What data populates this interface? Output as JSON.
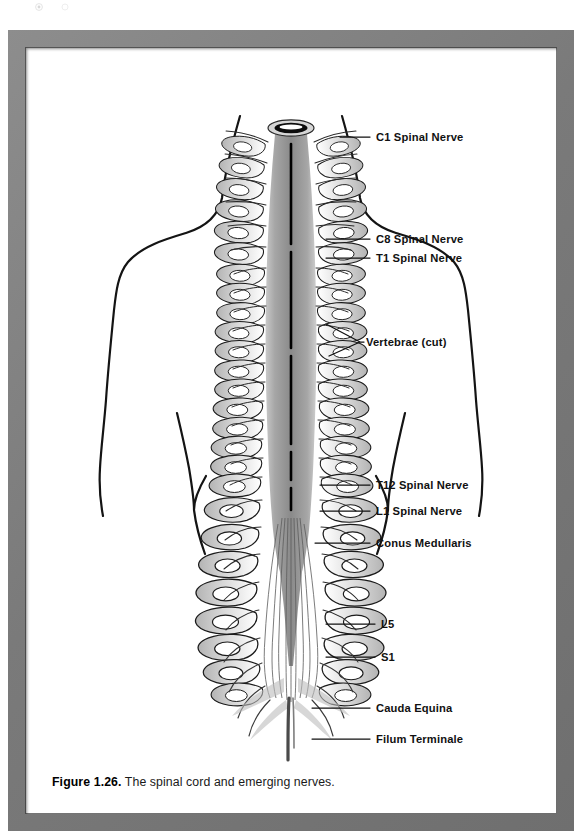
{
  "figure": {
    "caption_label": "Figure 1.26.",
    "caption_text": " The spinal cord and emerging nerves.",
    "frame_color": "#7e7e7e",
    "canvas_color": "#ffffff",
    "ink_color": "#111111"
  },
  "illustration": {
    "title": "The spinal cord and emerging nerves",
    "subject": "posterior view of human torso with vertebral column cut open exposing spinal cord",
    "cord_color": "#9a9a9a",
    "cord_center_line_color": "#000000",
    "outline_color": "#141414"
  },
  "labels": [
    {
      "id": "c1",
      "text": "C1 Spinal Nerve",
      "x": 350,
      "y": 93,
      "leader_x1": 314,
      "leader_y1": 89,
      "leader_x2": 344,
      "leader_y2": 89
    },
    {
      "id": "c8",
      "text": "C8 Spinal Nerve",
      "x": 350,
      "y": 195,
      "leader_x1": 300,
      "leader_y1": 191,
      "leader_x2": 344,
      "leader_y2": 191
    },
    {
      "id": "t1",
      "text": "T1 Spinal Nerve",
      "x": 350,
      "y": 214,
      "leader_x1": 300,
      "leader_y1": 210,
      "leader_x2": 344,
      "leader_y2": 210
    },
    {
      "id": "vert",
      "text": "Vertebrae (cut)",
      "x": 340,
      "y": 298,
      "leader_x1": 306,
      "leader_y1": 294,
      "leader_x2": 334,
      "leader_y2": 294
    },
    {
      "id": "t12",
      "text": "T12 Spinal Nerve",
      "x": 350,
      "y": 441,
      "leader_x1": 294,
      "leader_y1": 437,
      "leader_x2": 344,
      "leader_y2": 437
    },
    {
      "id": "l1",
      "text": "L1 Spinal Nerve",
      "x": 350,
      "y": 467,
      "leader_x1": 294,
      "leader_y1": 463,
      "leader_x2": 344,
      "leader_y2": 463
    },
    {
      "id": "conus",
      "text": "Conus Medullaris",
      "x": 350,
      "y": 499,
      "leader_x1": 289,
      "leader_y1": 495,
      "leader_x2": 344,
      "leader_y2": 495
    },
    {
      "id": "l5",
      "text": "L5",
      "x": 355,
      "y": 580,
      "leader_x1": 300,
      "leader_y1": 576,
      "leader_x2": 349,
      "leader_y2": 576
    },
    {
      "id": "s1",
      "text": "S1",
      "x": 355,
      "y": 613,
      "leader_x1": 300,
      "leader_y1": 609,
      "leader_x2": 349,
      "leader_y2": 609
    },
    {
      "id": "cauda",
      "text": "Cauda Equina",
      "x": 350,
      "y": 664,
      "leader_x1": 286,
      "leader_y1": 660,
      "leader_x2": 344,
      "leader_y2": 660
    },
    {
      "id": "filum",
      "text": "Filum Terminale",
      "x": 350,
      "y": 695,
      "leader_x1": 286,
      "leader_y1": 691,
      "leader_x2": 344,
      "leader_y2": 691
    }
  ]
}
